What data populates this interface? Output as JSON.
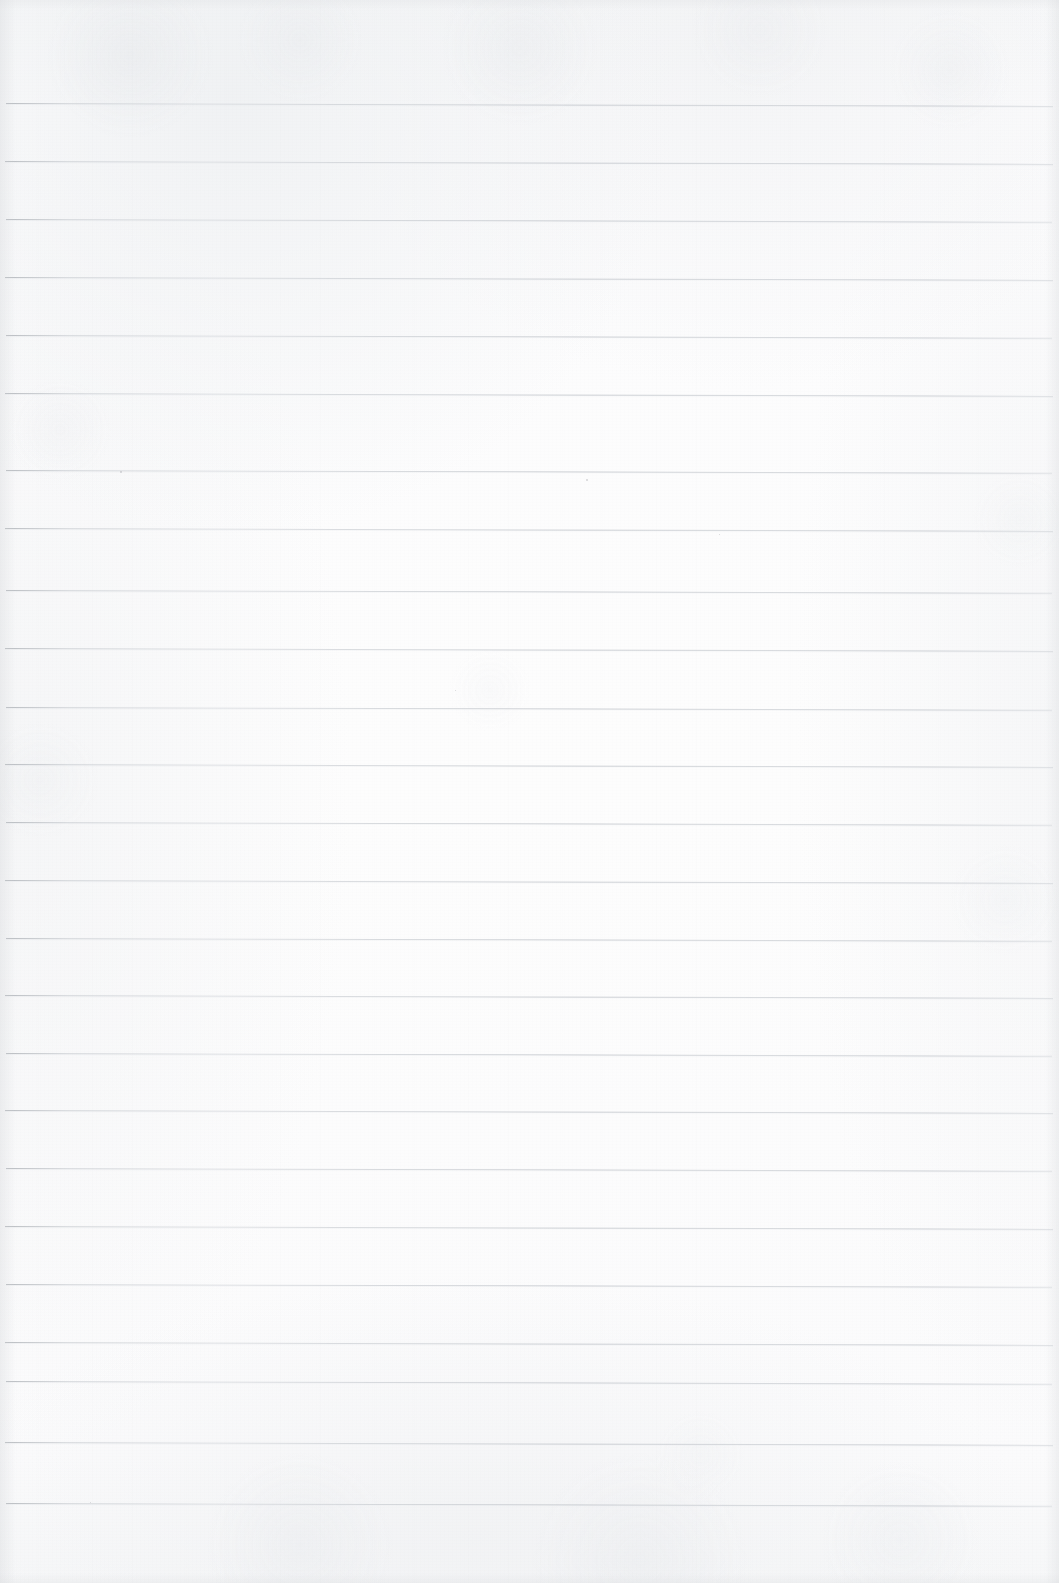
{
  "document": {
    "kind": "scanned-ruled-notebook-page",
    "title": "Blank Lined Notebook Page",
    "content_text": "",
    "handwriting_present": "no",
    "printed_text_present": "no",
    "page_width_px": 1059,
    "page_height_px": 1583
  },
  "paper": {
    "background_color": "#fcfcfd",
    "edge_tone_color": "#f3f4f5",
    "texture": "mottled scan grain with faint vertical streaks",
    "vignette": "soft grey darkening along all four edges"
  },
  "ruling": {
    "style": "wide-ruled horizontal lines",
    "line_color": "#c3c7cc",
    "line_thickness_px": 1,
    "line_count": 25,
    "line_spacing_px": 58,
    "first_line_y_px": 103,
    "last_line_y_px": 1503,
    "left_inset_px": 6,
    "right_inset_px": 1053,
    "tilt_description": "lines slope very slightly downward toward the right (~0.15 degrees)",
    "margin_rule_present": "no",
    "top_margin_px": 103,
    "bottom_margin_px": 80,
    "lines": [
      {
        "index": 1,
        "y": 103,
        "tilt_deg": 0.16,
        "left": 6,
        "right": 1053
      },
      {
        "index": 2,
        "y": 161,
        "tilt_deg": 0.16,
        "left": 5,
        "right": 1053
      },
      {
        "index": 3,
        "y": 219,
        "tilt_deg": 0.15,
        "left": 6,
        "right": 1052
      },
      {
        "index": 4,
        "y": 277,
        "tilt_deg": 0.16,
        "left": 5,
        "right": 1053
      },
      {
        "index": 5,
        "y": 335,
        "tilt_deg": 0.15,
        "left": 6,
        "right": 1052
      },
      {
        "index": 6,
        "y": 393,
        "tilt_deg": 0.16,
        "left": 5,
        "right": 1053
      },
      {
        "index": 7,
        "y": 470,
        "tilt_deg": 0.15,
        "left": 6,
        "right": 1052
      },
      {
        "index": 8,
        "y": 528,
        "tilt_deg": 0.16,
        "left": 5,
        "right": 1053
      },
      {
        "index": 9,
        "y": 590,
        "tilt_deg": 0.15,
        "left": 6,
        "right": 1052
      },
      {
        "index": 10,
        "y": 648,
        "tilt_deg": 0.16,
        "left": 5,
        "right": 1053
      },
      {
        "index": 11,
        "y": 707,
        "tilt_deg": 0.15,
        "left": 6,
        "right": 1052
      },
      {
        "index": 12,
        "y": 764,
        "tilt_deg": 0.16,
        "left": 5,
        "right": 1053
      },
      {
        "index": 13,
        "y": 822,
        "tilt_deg": 0.15,
        "left": 6,
        "right": 1052
      },
      {
        "index": 14,
        "y": 880,
        "tilt_deg": 0.16,
        "left": 5,
        "right": 1053
      },
      {
        "index": 15,
        "y": 938,
        "tilt_deg": 0.15,
        "left": 6,
        "right": 1052
      },
      {
        "index": 16,
        "y": 995,
        "tilt_deg": 0.16,
        "left": 5,
        "right": 1053
      },
      {
        "index": 17,
        "y": 1053,
        "tilt_deg": 0.15,
        "left": 6,
        "right": 1052
      },
      {
        "index": 18,
        "y": 1110,
        "tilt_deg": 0.16,
        "left": 5,
        "right": 1053
      },
      {
        "index": 19,
        "y": 1168,
        "tilt_deg": 0.15,
        "left": 6,
        "right": 1052
      },
      {
        "index": 20,
        "y": 1226,
        "tilt_deg": 0.16,
        "left": 5,
        "right": 1053
      },
      {
        "index": 21,
        "y": 1284,
        "tilt_deg": 0.15,
        "left": 6,
        "right": 1052
      },
      {
        "index": 22,
        "y": 1342,
        "tilt_deg": 0.16,
        "left": 5,
        "right": 1053
      },
      {
        "index": 23,
        "y": 1381,
        "tilt_deg": 0.15,
        "left": 6,
        "right": 1052
      },
      {
        "index": 24,
        "y": 1442,
        "tilt_deg": 0.16,
        "left": 5,
        "right": 1053
      },
      {
        "index": 25,
        "y": 1503,
        "tilt_deg": 0.15,
        "left": 6,
        "right": 1052
      }
    ]
  },
  "artifacts": {
    "specks": [
      {
        "x": 120,
        "y": 471,
        "size": 2
      },
      {
        "x": 586,
        "y": 479,
        "size": 2
      },
      {
        "x": 719,
        "y": 534,
        "size": 1
      },
      {
        "x": 455,
        "y": 690,
        "size": 1
      },
      {
        "x": 90,
        "y": 1502,
        "size": 1
      }
    ]
  }
}
